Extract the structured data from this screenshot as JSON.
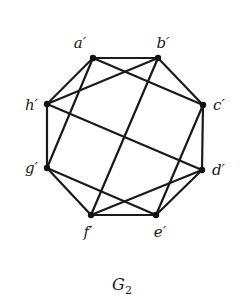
{
  "graph": {
    "caption": "G",
    "caption_subscript": "2",
    "nodes": [
      {
        "id": "a",
        "label": "a′",
        "x": 93,
        "y": 58,
        "lx": 80,
        "ly": 48,
        "anchor": "middle"
      },
      {
        "id": "b",
        "label": "b′",
        "x": 158,
        "y": 58,
        "lx": 163,
        "ly": 48,
        "anchor": "middle"
      },
      {
        "id": "c",
        "label": "c′",
        "x": 203,
        "y": 105,
        "lx": 213,
        "ly": 110,
        "anchor": "start"
      },
      {
        "id": "d",
        "label": "d′",
        "x": 202,
        "y": 170,
        "lx": 212,
        "ly": 175,
        "anchor": "start"
      },
      {
        "id": "e",
        "label": "e′",
        "x": 156,
        "y": 215,
        "lx": 160,
        "ly": 237,
        "anchor": "middle"
      },
      {
        "id": "f",
        "label": "f′",
        "x": 91,
        "y": 215,
        "lx": 88,
        "ly": 237,
        "anchor": "middle"
      },
      {
        "id": "g",
        "label": "g′",
        "x": 47,
        "y": 168,
        "lx": 38,
        "ly": 173,
        "anchor": "end"
      },
      {
        "id": "h",
        "label": "h′",
        "x": 47,
        "y": 104,
        "lx": 38,
        "ly": 110,
        "anchor": "end"
      }
    ],
    "edges": [
      [
        "a",
        "b"
      ],
      [
        "a",
        "h"
      ],
      [
        "a",
        "c"
      ],
      [
        "a",
        "g"
      ],
      [
        "b",
        "h"
      ],
      [
        "b",
        "c"
      ],
      [
        "b",
        "f"
      ],
      [
        "h",
        "g"
      ],
      [
        "h",
        "d"
      ],
      [
        "c",
        "d"
      ],
      [
        "c",
        "e"
      ],
      [
        "g",
        "f"
      ],
      [
        "g",
        "e"
      ],
      [
        "d",
        "f"
      ],
      [
        "d",
        "e"
      ],
      [
        "f",
        "e"
      ]
    ]
  }
}
